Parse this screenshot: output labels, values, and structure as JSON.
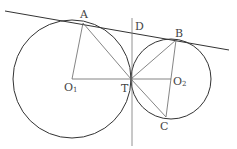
{
  "diagram": {
    "colors": {
      "stroke": "#333333",
      "thin": "#777777",
      "label": "#444444"
    },
    "points": {
      "A": {
        "label": "A",
        "x": 83,
        "y": 23
      },
      "B": {
        "label": "B",
        "x": 176,
        "y": 40
      },
      "C": {
        "label": "C",
        "x": 166,
        "y": 117
      },
      "D": {
        "label": "D",
        "x": 132,
        "y": 31
      },
      "T": {
        "label": "T",
        "x": 131,
        "y": 79
      },
      "O1": {
        "label": "O",
        "sub": "1",
        "x": 72,
        "y": 79
      },
      "O2": {
        "label": "O",
        "sub": "2",
        "x": 171,
        "y": 79
      }
    },
    "circles": [
      {
        "name": "circle-O1",
        "cx": 72,
        "cy": 79,
        "r": 59
      },
      {
        "name": "circle-O2",
        "cx": 171,
        "cy": 79,
        "r": 40
      }
    ]
  }
}
